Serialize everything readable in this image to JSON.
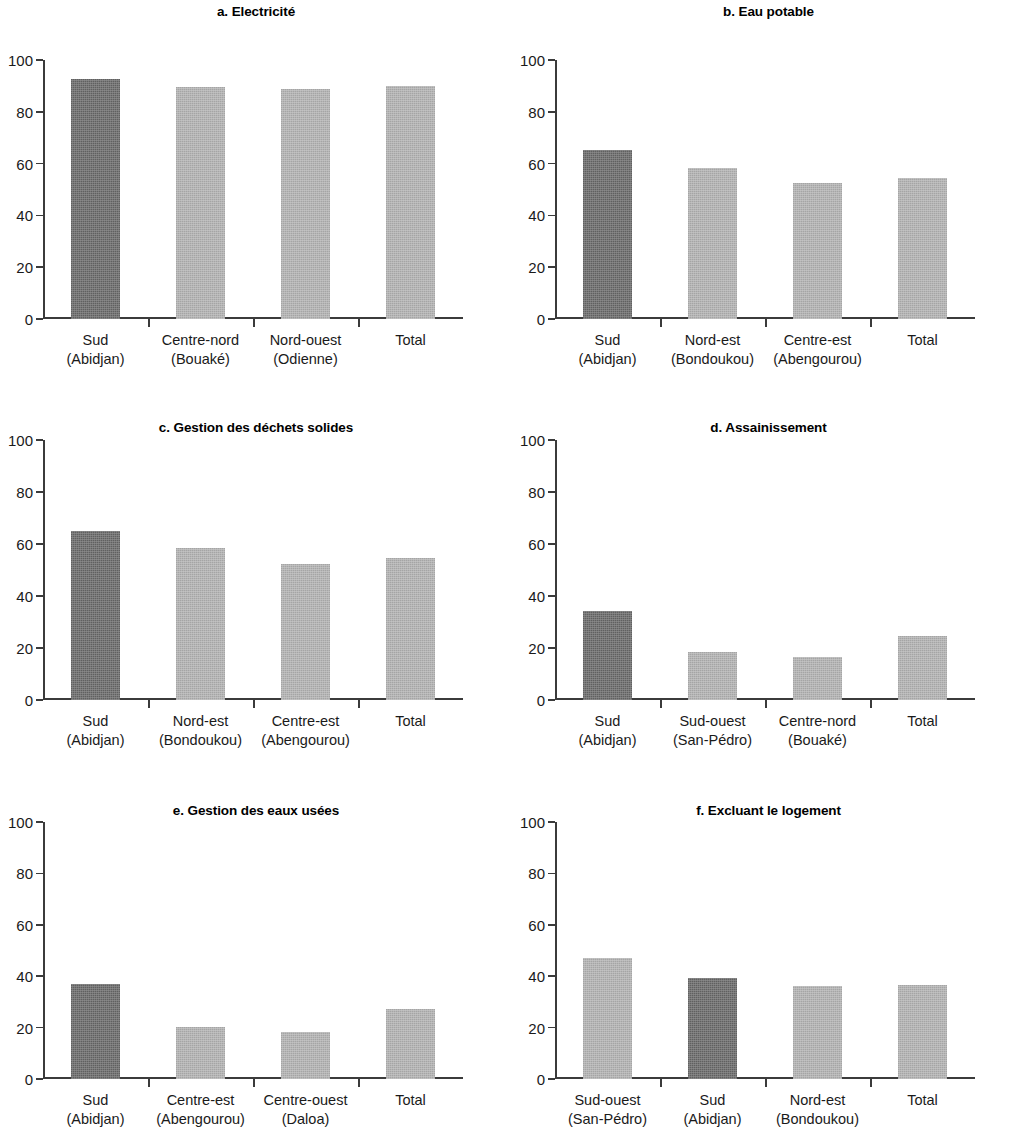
{
  "figure": {
    "panel_count": 6,
    "colors": {
      "dark_bar": "#686868",
      "light_bar": "#b2b2b2",
      "axis": "#3b3b3b",
      "text": "#1a1a1a"
    }
  },
  "chart_data": [
    {
      "type": "bar",
      "panel": "a",
      "title": "a. Electricité",
      "categories": [
        "Sud\n(Abidjan)",
        "Centre-nord\n(Bouaké)",
        "Nord-ouest\n(Odienne)",
        "Total"
      ],
      "category_lines": [
        [
          "Sud",
          "(Abidjan)"
        ],
        [
          "Centre-nord",
          "(Bouaké)"
        ],
        [
          "Nord-ouest",
          "(Odienne)"
        ],
        [
          "Total",
          ""
        ]
      ],
      "values": [
        92.7,
        89.5,
        89.0,
        90.0
      ],
      "highlight": [
        true,
        false,
        false,
        false
      ],
      "xlabel": "",
      "ylabel": "",
      "ylim": [
        0,
        100
      ],
      "yticks": [
        0,
        20,
        40,
        60,
        80,
        100
      ],
      "grid": false,
      "legend": "none"
    },
    {
      "type": "bar",
      "panel": "b",
      "title": "b. Eau potable",
      "categories": [
        "Sud\n(Abidjan)",
        "Nord-est\n(Bondoukou)",
        "Centre-est\n(Abengourou)",
        "Total"
      ],
      "category_lines": [
        [
          "Sud",
          "(Abidjan)"
        ],
        [
          "Nord-est",
          "(Bondoukou)"
        ],
        [
          "Centre-est",
          "(Abengourou)"
        ],
        [
          "Total",
          ""
        ]
      ],
      "values": [
        65.3,
        58.3,
        52.5,
        54.4
      ],
      "highlight": [
        true,
        false,
        false,
        false
      ],
      "xlabel": "",
      "ylabel": "",
      "ylim": [
        0,
        100
      ],
      "yticks": [
        0,
        20,
        40,
        60,
        80,
        100
      ],
      "grid": false,
      "legend": "none"
    },
    {
      "type": "bar",
      "panel": "c",
      "title": "c. Gestion des déchets solides",
      "categories": [
        "Sud\n(Abidjan)",
        "Nord-est\n(Bondoukou)",
        "Centre-est\n(Abengourou)",
        "Total"
      ],
      "category_lines": [
        [
          "Sud",
          "(Abidjan)"
        ],
        [
          "Nord-est",
          "(Bondoukou)"
        ],
        [
          "Centre-est",
          "(Abengourou)"
        ],
        [
          "Total",
          ""
        ]
      ],
      "values": [
        65.0,
        58.3,
        52.5,
        54.5
      ],
      "highlight": [
        true,
        false,
        false,
        false
      ],
      "xlabel": "",
      "ylabel": "",
      "ylim": [
        0,
        100
      ],
      "yticks": [
        0,
        20,
        40,
        60,
        80,
        100
      ],
      "grid": false,
      "legend": "none"
    },
    {
      "type": "bar",
      "panel": "d",
      "title": "d. Assainissement",
      "categories": [
        "Sud\n(Abidjan)",
        "Sud-ouest\n(San-Pédro)",
        "Centre-nord\n(Bouaké)",
        "Total"
      ],
      "category_lines": [
        [
          "Sud",
          "(Abidjan)"
        ],
        [
          "Sud-ouest",
          "(San-Pédro)"
        ],
        [
          "Centre-nord",
          "(Bouaké)"
        ],
        [
          "Total",
          ""
        ]
      ],
      "values": [
        34.2,
        18.6,
        16.4,
        24.8
      ],
      "highlight": [
        true,
        false,
        false,
        false
      ],
      "xlabel": "",
      "ylabel": "",
      "ylim": [
        0,
        100
      ],
      "yticks": [
        0,
        20,
        40,
        60,
        80,
        100
      ],
      "grid": false,
      "legend": "none"
    },
    {
      "type": "bar",
      "panel": "e",
      "title": "e. Gestion des eaux usées",
      "categories": [
        "Sud\n(Abidjan)",
        "Centre-est\n(Abengourou)",
        "Centre-ouest\n(Daloa)",
        "Total"
      ],
      "category_lines": [
        [
          "Sud",
          "(Abidjan)"
        ],
        [
          "Centre-est",
          "(Abengourou)"
        ],
        [
          "Centre-ouest",
          "(Daloa)"
        ],
        [
          "Total",
          ""
        ]
      ],
      "values": [
        36.9,
        20.2,
        18.3,
        27.3
      ],
      "highlight": [
        true,
        false,
        false,
        false
      ],
      "xlabel": "",
      "ylabel": "",
      "ylim": [
        0,
        100
      ],
      "yticks": [
        0,
        20,
        40,
        60,
        80,
        100
      ],
      "grid": false,
      "legend": "none"
    },
    {
      "type": "bar",
      "panel": "f",
      "title": "f. Excluant le logement",
      "categories": [
        "Sud-ouest\n(San-Pédro)",
        "Sud\n(Abidjan)",
        "Nord-est\n(Bondoukou)",
        "Total"
      ],
      "category_lines": [
        [
          "Sud-ouest",
          "(San-Pédro)"
        ],
        [
          "Sud",
          "(Abidjan)"
        ],
        [
          "Nord-est",
          "(Bondoukou)"
        ],
        [
          "Total",
          ""
        ]
      ],
      "values": [
        47.2,
        39.3,
        36.3,
        36.7
      ],
      "highlight": [
        false,
        true,
        false,
        false
      ],
      "xlabel": "",
      "ylabel": "",
      "ylim": [
        0,
        100
      ],
      "yticks": [
        0,
        20,
        40,
        60,
        80,
        100
      ],
      "grid": false,
      "legend": "none"
    }
  ]
}
